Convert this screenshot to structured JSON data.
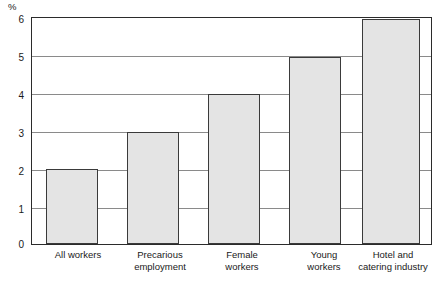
{
  "chart_data": {
    "type": "bar",
    "title": "",
    "xlabel": "",
    "ylabel": "%",
    "categories": [
      "All workers",
      "Precarious employment",
      "Female workers",
      "Young workers",
      "Hotel and catering industry"
    ],
    "values": [
      2,
      3,
      4,
      5,
      6
    ],
    "ylim": [
      0,
      6
    ],
    "yticks": [
      "0",
      "1",
      "2",
      "3",
      "4",
      "5",
      "6"
    ],
    "grid": true,
    "legend": "none",
    "colors": {
      "bar_fill": "#e4e4e4",
      "bar_border": "#3a3a3a",
      "frame": "#2b2b2b",
      "gridline": "#8a8a8a",
      "text": "#1a1a1a",
      "background": "#ffffff"
    }
  },
  "axis": {
    "unit_label": "%",
    "tick_6": "6",
    "tick_5": "5",
    "tick_4": "4",
    "tick_3": "3",
    "tick_2": "2",
    "tick_1": "1",
    "tick_0": "0"
  },
  "categories": {
    "cat_0_line1": "All workers",
    "cat_0_line2": "",
    "cat_1_line1": "Precarious",
    "cat_1_line2": "employment",
    "cat_2_line1": "Female",
    "cat_2_line2": "workers",
    "cat_3_line1": "Young",
    "cat_3_line2": "workers",
    "cat_4_line1": "Hotel and",
    "cat_4_line2": "catering industry"
  }
}
